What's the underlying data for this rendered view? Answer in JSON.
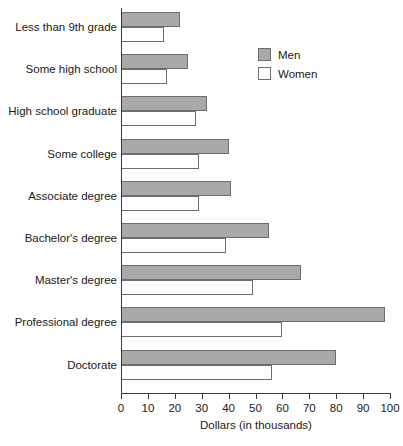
{
  "chart_data": {
    "type": "bar",
    "orientation": "horizontal",
    "title": "",
    "xlabel": "Dollars (in thousands)",
    "ylabel": "",
    "xlim": [
      0,
      100
    ],
    "xticks": [
      0,
      10,
      20,
      30,
      40,
      50,
      60,
      70,
      80,
      90,
      100
    ],
    "grid": false,
    "legend_position": "upper right",
    "categories": [
      "Less than 9th grade",
      "Some high school",
      "High school graduate",
      "Some college",
      "Associate degree",
      "Bachelor's degree",
      "Master's degree",
      "Professional degree",
      "Doctorate"
    ],
    "series": [
      {
        "name": "Men",
        "color": "#a9a9a9",
        "values": [
          22,
          25,
          32,
          40,
          41,
          55,
          67,
          98,
          80
        ]
      },
      {
        "name": "Women",
        "color": "#ffffff",
        "values": [
          16,
          17,
          28,
          29,
          29,
          39,
          49,
          60,
          56
        ]
      }
    ]
  },
  "legend": {
    "entries": [
      {
        "label": "Men",
        "swatch": "men"
      },
      {
        "label": "Women",
        "swatch": "women"
      }
    ]
  }
}
